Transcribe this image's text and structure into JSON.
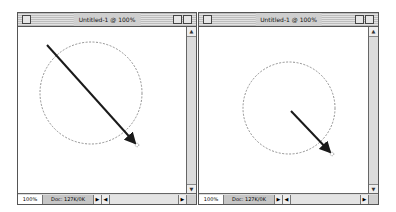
{
  "windows": [
    {
      "title": "Untitled-1 @ 100%",
      "status": {
        "zoom": "100%",
        "doc_size": "Doc: 127K/0K"
      },
      "scroll": {
        "up": "▲",
        "down": "▼",
        "left": "◀",
        "right": "▶",
        "menu": "▶"
      },
      "selection": {
        "shape": "ellipse",
        "cx": 91,
        "cy": 93,
        "r": 51
      },
      "arrow": {
        "x1": 47,
        "y1": 45,
        "x2": 135,
        "y2": 143
      }
    },
    {
      "title": "Untitled-1 @ 100%",
      "status": {
        "zoom": "100%",
        "doc_size": "Doc: 127K/0K"
      },
      "scroll": {
        "up": "▲",
        "down": "▼",
        "left": "◀",
        "right": "▶",
        "menu": "▶"
      },
      "selection": {
        "shape": "ellipse",
        "cx": 289,
        "cy": 108,
        "r": 46
      },
      "arrow": {
        "x1": 291,
        "y1": 111,
        "x2": 330,
        "y2": 152
      }
    }
  ],
  "colors": {
    "arrow": "#1a1a1a",
    "marquee": "#777777",
    "titlebar": "#cfcfcf"
  }
}
